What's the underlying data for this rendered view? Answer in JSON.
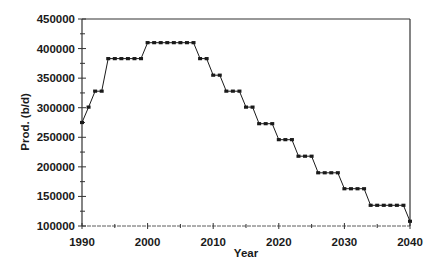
{
  "chart_data": {
    "type": "line",
    "title": "",
    "xlabel": "Year",
    "ylabel": "Prod. (b/d)",
    "xlim": [
      1990,
      2040
    ],
    "ylim": [
      100000,
      450000
    ],
    "x_ticks": [
      1990,
      2000,
      2010,
      2020,
      2030,
      2040
    ],
    "x_tick_labels": [
      "1990",
      "2000",
      "2010",
      "2020",
      "2030",
      "2040"
    ],
    "x_minor_ticks": [
      1995,
      2005,
      2015,
      2025,
      2035
    ],
    "y_ticks": [
      100000,
      150000,
      200000,
      250000,
      300000,
      350000,
      400000,
      450000
    ],
    "y_tick_labels": [
      "100000",
      "150000",
      "200000",
      "250000",
      "300000",
      "350000",
      "400000",
      "450000"
    ],
    "y_minor_ticks": [
      125000,
      175000,
      225000,
      275000,
      325000,
      375000,
      425000
    ],
    "grid": false,
    "legend": null,
    "series": [
      {
        "name": "Production",
        "marker": "square",
        "color": "#1a1a1a",
        "x": [
          1990,
          1991,
          1992,
          1993,
          1994,
          1995,
          1996,
          1997,
          1998,
          1999,
          2000,
          2001,
          2002,
          2003,
          2004,
          2005,
          2006,
          2007,
          2008,
          2009,
          2010,
          2011,
          2012,
          2013,
          2014,
          2015,
          2016,
          2017,
          2018,
          2019,
          2020,
          2021,
          2022,
          2023,
          2024,
          2025,
          2026,
          2027,
          2028,
          2029,
          2030,
          2031,
          2032,
          2033,
          2034,
          2035,
          2036,
          2037,
          2038,
          2039,
          2040
        ],
        "values": [
          275000,
          301000,
          328000,
          328000,
          383000,
          383000,
          383000,
          383000,
          383000,
          383000,
          410000,
          410000,
          410000,
          410000,
          410000,
          410000,
          410000,
          410000,
          383000,
          383000,
          355000,
          355000,
          328000,
          328000,
          328000,
          301000,
          301000,
          273000,
          273000,
          273000,
          246000,
          246000,
          246000,
          218000,
          218000,
          218000,
          190000,
          190000,
          190000,
          190000,
          163000,
          163000,
          163000,
          163000,
          135000,
          135000,
          135000,
          135000,
          135000,
          135000,
          108000
        ]
      }
    ]
  },
  "colors": {
    "axis": "#333333",
    "line": "#1a1a1a",
    "background": "#ffffff"
  }
}
